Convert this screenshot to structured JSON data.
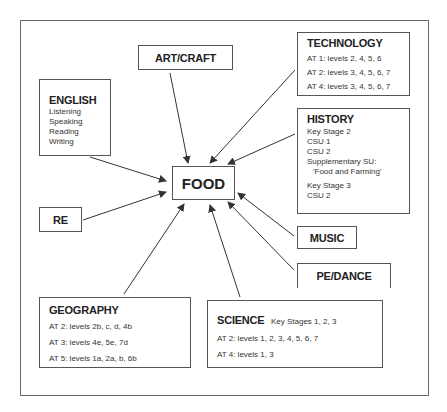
{
  "diagram": {
    "center": {
      "label": "FOOD"
    },
    "nodes": {
      "art_craft": {
        "title": "ART/CRAFT"
      },
      "english": {
        "title": "ENGLISH",
        "lines": [
          "Listening",
          "Speaking",
          "Reading",
          "Writing"
        ]
      },
      "technology": {
        "title": "TECHNOLOGY",
        "lines": [
          "AT 1: levels 2, 4, 5, 6",
          "AT 2: levels 3, 4, 5, 6, 7",
          "AT 4: levels 3, 4, 5, 6, 7"
        ]
      },
      "history": {
        "title": "HISTORY",
        "lines": [
          "Key Stage 2",
          "CSU 1",
          "CSU 2",
          "Supplementary SU:",
          "'Food and Farming'",
          "Key Stage 3",
          "CSU 2"
        ]
      },
      "re": {
        "title": "RE"
      },
      "music": {
        "title": "MUSIC"
      },
      "pe_dance": {
        "title": "PE/DANCE"
      },
      "geography": {
        "title": "GEOGRAPHY",
        "lines": [
          "AT 2: levels 2b, c, d, 4b",
          "AT 3: levels 4e, 5e, 7d",
          "AT 5: levels 1a, 2a, b, 6b"
        ]
      },
      "science": {
        "title": "SCIENCE",
        "subtitle": "Key Stages 1, 2, 3",
        "lines": [
          "AT 2: levels 1, 2, 3, 4, 5, 6, 7",
          "AT 4: levels 1, 3"
        ]
      }
    },
    "edges": [
      {
        "from": "art_craft",
        "to": "FOOD"
      },
      {
        "from": "english",
        "to": "FOOD"
      },
      {
        "from": "technology",
        "to": "FOOD"
      },
      {
        "from": "history",
        "to": "FOOD"
      },
      {
        "from": "re",
        "to": "FOOD"
      },
      {
        "from": "music",
        "to": "FOOD"
      },
      {
        "from": "pe_dance",
        "to": "FOOD"
      },
      {
        "from": "geography",
        "to": "FOOD"
      },
      {
        "from": "science",
        "to": "FOOD"
      }
    ]
  }
}
